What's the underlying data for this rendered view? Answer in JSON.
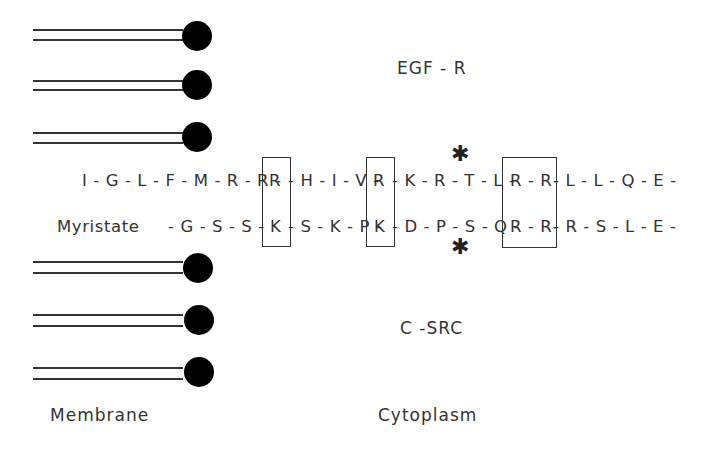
{
  "labels": {
    "egf_r": "EGF - R",
    "c_src": "C -SRC",
    "membrane": "Membrane",
    "cytoplasm": "Cytoplasm",
    "myristate": "Myristate"
  },
  "sequences": {
    "egf_r_row": {
      "seg1": "I - G - L - F - M - R - R -",
      "box1": "R",
      "seg2": "- H - I - V -",
      "box2": "R",
      "seg3": "- K - R - T - L -",
      "box3": "R - R",
      "seg4": "- L - L - Q - E -"
    },
    "c_src_row": {
      "seg1": "- G - S - S -",
      "box1": "K",
      "seg2": "- S - K - P -",
      "box2": "K",
      "seg3": "- D - P - S - Q -",
      "box3": "R - R",
      "seg4": "- R - S - L - E -"
    }
  },
  "annotations": {
    "phospho_marker_top": "✱",
    "phospho_marker_bottom": "✱"
  },
  "membrane_lipids": {
    "top_count": 3,
    "bottom_count": 3
  },
  "colors": {
    "ink": "#333333",
    "lipid_head": "#000000",
    "background": "#ffffff"
  }
}
